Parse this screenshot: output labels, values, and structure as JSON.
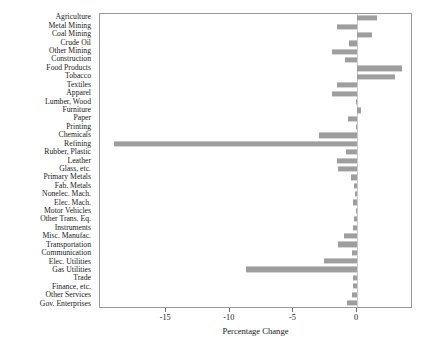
{
  "chart_data": {
    "type": "bar",
    "orientation": "horizontal",
    "title": "",
    "xlabel": "Percentage Change",
    "ylabel": "",
    "xlim": [
      -20.2,
      4.4
    ],
    "xticks": [
      -15,
      -10,
      -5,
      0
    ],
    "xticklabels": [
      "-15",
      "-10",
      "-5",
      "0"
    ],
    "grid": false,
    "legend": null,
    "bar_color": "#9e9e9e",
    "zero_line_color": "#c9c9c9",
    "categories": [
      "Agriculture",
      "Metal Mining",
      "Coal Mining",
      "Crude Oil",
      "Other Mining",
      "Construction",
      "Food Products",
      "Tobacco",
      "Textiles",
      "Apparel",
      "Lumber, Wood",
      "Furniture",
      "Paper",
      "Printing",
      "Chemicals",
      "Refining",
      "Rubber, Plastic",
      "Leather",
      "Glass, etc.",
      "Primary Metals",
      "Fab. Metals",
      "Nonelec. Mach.",
      "Elec. Mach.",
      "Motor Vehicles",
      "Other Trans. Eq.",
      "Instruments",
      "Misc. Manufac.",
      "Transportation",
      "Communication",
      "Elec. Utilities",
      "Gas Utilities",
      "Trade",
      "Finance, etc.",
      "Other Services",
      "Gov. Enterprises"
    ],
    "values": [
      1.6,
      -1.6,
      1.2,
      -0.6,
      -2.0,
      -0.95,
      3.5,
      3.0,
      -1.55,
      -2.0,
      -0.1,
      0.35,
      -0.7,
      -0.1,
      -3.0,
      -19.1,
      -0.85,
      -1.55,
      -1.5,
      -0.45,
      -0.2,
      -0.15,
      -0.35,
      -0.1,
      -0.2,
      -0.35,
      -1.0,
      -1.5,
      -0.4,
      -2.6,
      -8.7,
      -0.3,
      -0.3,
      -0.4,
      -0.8
    ]
  }
}
